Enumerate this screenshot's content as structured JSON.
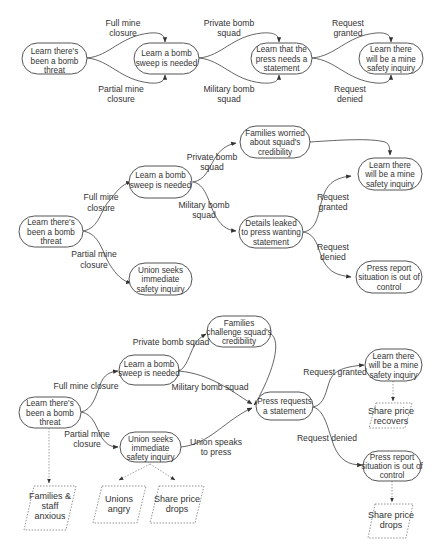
{
  "diagram1": {
    "nodes": {
      "n1": [
        "Learn there's",
        "been a bomb",
        "threat"
      ],
      "n2": [
        "Learn a bomb",
        "sweep is needed"
      ],
      "n3": [
        "Learn that the",
        "press needs a",
        "statement"
      ],
      "n4": [
        "Learn there",
        "will be a mine",
        "safety inquiry"
      ]
    },
    "labels": {
      "full_closure": [
        "Full mine",
        "closure"
      ],
      "partial_closure": [
        "Partial mine",
        "closure"
      ],
      "private_squad": [
        "Private bomb",
        "squad"
      ],
      "military_squad": [
        "Military bomb",
        "squad"
      ],
      "req_granted": [
        "Request",
        "granted"
      ],
      "req_denied": [
        "Request",
        "denied"
      ]
    }
  },
  "diagram2": {
    "nodes": {
      "n1": [
        "Learn there's",
        "been a bomb",
        "threat"
      ],
      "n2": [
        "Learn a bomb",
        "sweep is needed"
      ],
      "union": [
        "Union seeks",
        "immediate",
        "safety inquiry"
      ],
      "families": [
        "Families worried",
        "about squad's",
        "credibility"
      ],
      "leaked": [
        "Details leaked",
        "to press wanting",
        "statement"
      ],
      "inquiry": [
        "Learn there",
        "will be a mine",
        "safety inquiry"
      ],
      "press_report": [
        "Press report",
        "situation is out of",
        "control"
      ]
    },
    "labels": {
      "full_closure": [
        "Full mine",
        "closure"
      ],
      "partial_closure": [
        "Partial mine",
        "closure"
      ],
      "private_squad": [
        "Private bomb",
        "squad"
      ],
      "military_squad": [
        "Military bomb",
        "squad"
      ],
      "req_granted": [
        "Request",
        "granted"
      ],
      "req_denied": [
        "Request",
        "denied"
      ]
    }
  },
  "diagram3": {
    "nodes": {
      "n1": [
        "Learn there's",
        "been a bomb",
        "threat"
      ],
      "n2": [
        "Learn a bomb",
        "sweep is needed"
      ],
      "families": [
        "Families",
        "challenge squad's",
        "credibility"
      ],
      "union": [
        "Union seeks",
        "immediate",
        "safety inquiry"
      ],
      "press_requests": [
        "Press requests",
        "a statement"
      ],
      "inquiry": [
        "Learn there",
        "will be a mine",
        "safety inquiry"
      ],
      "press_report": [
        "Press report",
        "situation is out of",
        "control"
      ]
    },
    "outcomes": {
      "families_anxious": [
        "Families &",
        "staff",
        "anxious"
      ],
      "unions_angry": [
        "Unions",
        "angry"
      ],
      "share_drops_left": [
        "Share price",
        "drops"
      ],
      "share_recovers": [
        "Share price",
        "recovers"
      ],
      "share_drops_right": [
        "Share price",
        "drops"
      ]
    },
    "labels": {
      "full_closure": "Full mine closure",
      "partial_closure": [
        "Partial mine",
        "closure"
      ],
      "private_squad": "Private bomb squad",
      "military_squad": "Military bomb squad",
      "union_speaks": [
        "Union speaks",
        "to press"
      ],
      "req_granted": "Request granted",
      "req_denied": "Request denied"
    }
  }
}
